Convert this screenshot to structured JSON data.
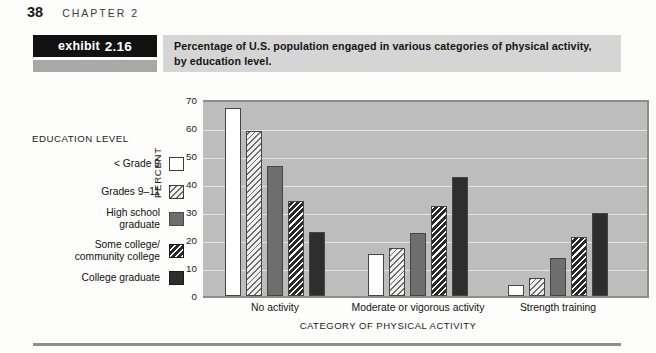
{
  "page": {
    "folio": "38",
    "chapter_label": "CHAPTER 2"
  },
  "exhibit": {
    "tag_word": "exhibit",
    "tag_number": "2.16",
    "caption_line1": "Percentage of U.S. population engaged in various categories of physical activity,",
    "caption_line2": "by education level."
  },
  "legend": {
    "title": "EDUCATION LEVEL",
    "items": [
      {
        "label": "< Grade 9",
        "pattern": "solid-white",
        "color": "#ffffff"
      },
      {
        "label": "Grades 9–11",
        "pattern": "light-diagonal-hatch",
        "color": "#f0f0f0"
      },
      {
        "label": "High school\ngraduate",
        "pattern": "solid-gray",
        "color": "#6e6e6e"
      },
      {
        "label": "Some college/\ncommunity college",
        "pattern": "dark-diagonal-hatch",
        "color": "#2a2a2a"
      },
      {
        "label": "College graduate",
        "pattern": "solid-black",
        "color": "#2e2e2e"
      }
    ]
  },
  "chart_data": {
    "type": "bar",
    "title": "Percentage of U.S. population engaged in various categories of physical activity, by education level.",
    "xlabel": "CATEGORY OF PHYSICAL ACTIVITY",
    "ylabel": "PERCENT",
    "ylim": [
      0,
      70
    ],
    "yticks": [
      0,
      10,
      20,
      30,
      40,
      50,
      60,
      70
    ],
    "ytick_labels": [
      "0",
      "10",
      "20",
      "30",
      "40",
      "50",
      "60",
      "70"
    ],
    "grid": true,
    "legend_position": "left-outside",
    "categories": [
      "No activity",
      "Moderate or vigorous activity",
      "Strength training"
    ],
    "series": [
      {
        "name": "< Grade 9",
        "values": [
          67,
          15,
          4
        ]
      },
      {
        "name": "Grades 9–11",
        "values": [
          59,
          17,
          6.5
        ]
      },
      {
        "name": "High school graduate",
        "values": [
          46.5,
          22.5,
          13.5
        ]
      },
      {
        "name": "Some college/community college",
        "values": [
          34,
          32,
          21
        ]
      },
      {
        "name": "College graduate",
        "values": [
          23,
          42.5,
          29.5
        ]
      }
    ]
  }
}
